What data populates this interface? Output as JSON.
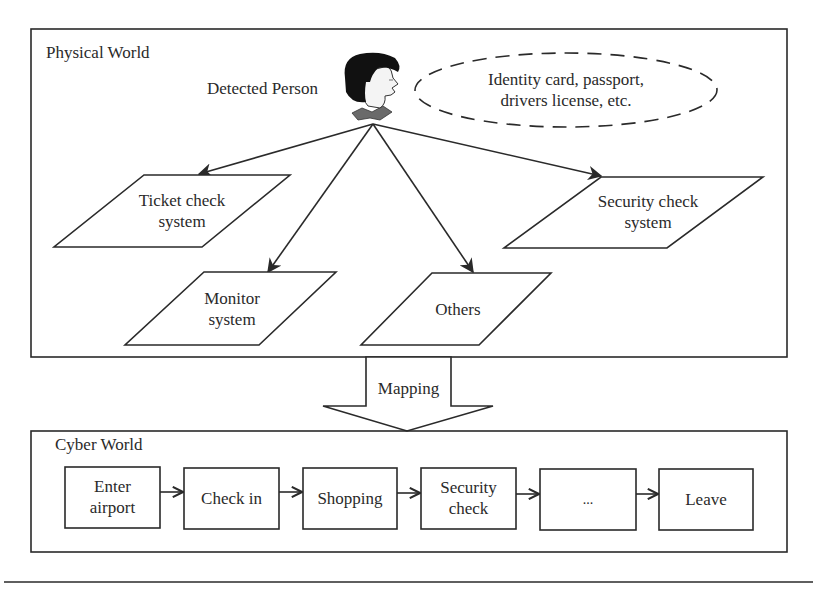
{
  "physical_world": {
    "title": "Physical World",
    "person_label": "Detected Person",
    "id_ellipse": {
      "line1": "Identity card, passport,",
      "line2": "drivers license, etc."
    },
    "systems": [
      {
        "id": "ticket",
        "line1": "Ticket check",
        "line2": "system"
      },
      {
        "id": "monitor",
        "line1": "Monitor",
        "line2": "system"
      },
      {
        "id": "others",
        "line1": "Others",
        "line2": ""
      },
      {
        "id": "security",
        "line1": "Security check",
        "line2": "system"
      }
    ]
  },
  "mapping": {
    "label": "Mapping"
  },
  "cyber_world": {
    "title": "Cyber World",
    "steps": [
      {
        "line1": "Enter",
        "line2": "airport"
      },
      {
        "line1": "Check in",
        "line2": ""
      },
      {
        "line1": "Shopping",
        "line2": ""
      },
      {
        "line1": "Security",
        "line2": "check"
      },
      {
        "line1": "...",
        "line2": ""
      },
      {
        "line1": "Leave",
        "line2": ""
      }
    ]
  },
  "colors": {
    "stroke": "#2a2a2a",
    "background": "#ffffff",
    "collar": "#6a6a6a",
    "hair": "#111111"
  }
}
